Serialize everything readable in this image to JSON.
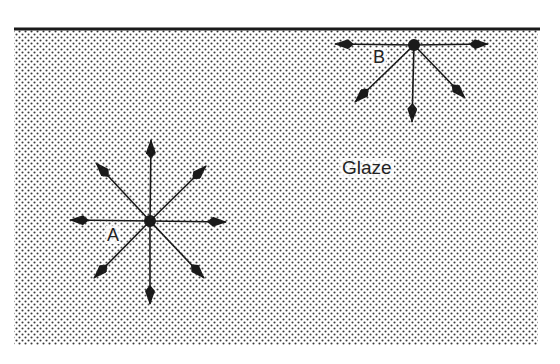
{
  "diagram": {
    "region_label": "Glaze",
    "colors": {
      "ink": "#1a1a1a",
      "background": "#ffffff",
      "stipple": "#3a3a3a"
    },
    "surface_line": {
      "x1": 14,
      "y1": 29,
      "x2": 540,
      "y2": 29
    },
    "region": {
      "x": 14,
      "y": 30,
      "width": 524,
      "height": 315
    },
    "points": [
      {
        "id": "A",
        "label": "A",
        "center": [
          150,
          221
        ],
        "arrow_tips": [
          [
            151,
            140
          ],
          [
            206,
            166
          ],
          [
            226,
            222
          ],
          [
            204,
            278
          ],
          [
            150,
            304
          ],
          [
            94,
            278
          ],
          [
            70,
            220
          ],
          [
            96,
            163
          ]
        ]
      },
      {
        "id": "B",
        "label": "B",
        "center": [
          414,
          45
        ],
        "arrow_tips": [
          [
            335,
            44
          ],
          [
            488,
            44
          ],
          [
            355,
            102
          ],
          [
            412,
            122
          ],
          [
            465,
            98
          ]
        ]
      }
    ]
  }
}
